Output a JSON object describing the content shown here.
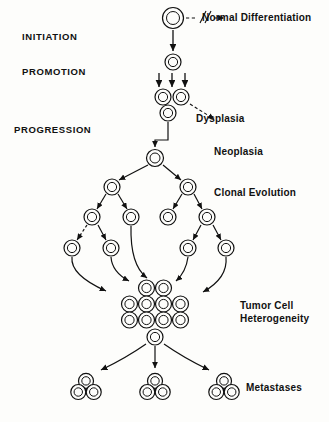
{
  "figure": {
    "background_color": "#fdfdfb",
    "ink_color": "#111111"
  },
  "stage_labels": [
    {
      "text": "INITIATION",
      "x": 22,
      "y": 40
    },
    {
      "text": "PROMOTION",
      "x": 22,
      "y": 75
    },
    {
      "text": "PROGRESSION",
      "x": 14,
      "y": 133
    }
  ],
  "outcome_labels": [
    {
      "text": "Normal Differentiation",
      "x": 202,
      "y": 21
    },
    {
      "text": "Dysplasia",
      "x": 196,
      "y": 122
    },
    {
      "text": "Neoplasia",
      "x": 214,
      "y": 155
    },
    {
      "text": "Clonal Evolution",
      "x": 214,
      "y": 196
    },
    {
      "text": "Tumor Cell",
      "x": 240,
      "y": 309
    },
    {
      "text": "Heterogeneity",
      "x": 240,
      "y": 322
    },
    {
      "text": "Metastases",
      "x": 246,
      "y": 391
    }
  ],
  "cells": [
    {
      "name": "stem-cell",
      "x": 173,
      "y": 18,
      "r": 10.5,
      "inner": 6.5
    },
    {
      "name": "initiated-cell",
      "x": 173,
      "y": 62,
      "r": 8.0,
      "inner": 4.6
    },
    {
      "name": "promoted-cell-a",
      "x": 163,
      "y": 97,
      "r": 8.0,
      "inner": 4.6
    },
    {
      "name": "promoted-cell-b",
      "x": 181,
      "y": 97,
      "r": 8.0,
      "inner": 4.6
    },
    {
      "name": "promoted-cell-c",
      "x": 168,
      "y": 113,
      "r": 8.0,
      "inner": 4.6
    },
    {
      "name": "neoplastic-cell",
      "x": 155,
      "y": 158,
      "r": 8.5,
      "inner": 5.0
    },
    {
      "name": "clone-left",
      "x": 112,
      "y": 187,
      "r": 8.0,
      "inner": 4.6
    },
    {
      "name": "clone-right",
      "x": 188,
      "y": 187,
      "r": 8.0,
      "inner": 4.6
    },
    {
      "name": "clone-l1",
      "x": 92,
      "y": 217,
      "r": 8.0,
      "inner": 4.6
    },
    {
      "name": "clone-l2",
      "x": 131,
      "y": 217,
      "r": 8.0,
      "inner": 4.6
    },
    {
      "name": "clone-r1",
      "x": 168,
      "y": 217,
      "r": 8.0,
      "inner": 4.6
    },
    {
      "name": "clone-r2",
      "x": 207,
      "y": 217,
      "r": 8.0,
      "inner": 4.6
    },
    {
      "name": "clone-l1a",
      "x": 72,
      "y": 248,
      "r": 8.0,
      "inner": 4.6
    },
    {
      "name": "clone-l1b",
      "x": 111,
      "y": 248,
      "r": 8.0,
      "inner": 4.6
    },
    {
      "name": "clone-r2a",
      "x": 188,
      "y": 248,
      "r": 8.0,
      "inner": 4.6
    },
    {
      "name": "clone-r2b",
      "x": 226,
      "y": 248,
      "r": 8.0,
      "inner": 4.6
    }
  ],
  "tumor_mass": {
    "name": "tumor-cell-heterogeneity-mass",
    "cell_radius": 8.0,
    "inner_radius": 4.6,
    "rows": [
      {
        "count": 2,
        "cx": 155,
        "cy": 288,
        "spacing": 17
      },
      {
        "count": 4,
        "cx": 155,
        "cy": 304,
        "spacing": 17
      },
      {
        "count": 4,
        "cx": 155,
        "cy": 320,
        "spacing": 17
      },
      {
        "count": 1,
        "cx": 155,
        "cy": 337,
        "spacing": 17
      }
    ]
  },
  "metastases": [
    {
      "name": "metastasis-left",
      "cx": 86,
      "cy": 388,
      "r": 7.5,
      "inner": 4.2
    },
    {
      "name": "metastasis-center",
      "cx": 155,
      "cy": 388,
      "r": 7.5,
      "inner": 4.2
    },
    {
      "name": "metastasis-right",
      "cx": 224,
      "cy": 388,
      "r": 7.5,
      "inner": 4.2
    }
  ],
  "connectors": {
    "normal_differentiation": {
      "name": "dashed-break-arrow",
      "description": "dashed arrow with double-slash break"
    },
    "promotion_arrow_count": 3
  }
}
